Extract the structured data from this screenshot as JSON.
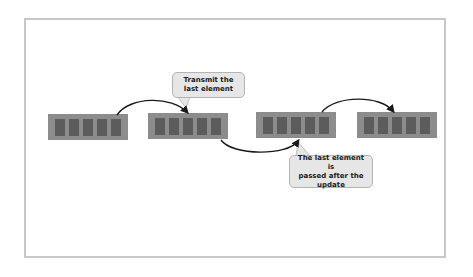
{
  "diagram": {
    "arrays": [
      {
        "id": "array-1",
        "slots": 5
      },
      {
        "id": "array-2",
        "slots": 5
      },
      {
        "id": "array-3",
        "slots": 5
      },
      {
        "id": "array-4",
        "slots": 5
      }
    ],
    "callouts": {
      "top": "Transmit the\nlast element",
      "bottom": "The last element is\npassed after the\nupdate"
    },
    "colors": {
      "array_fill": "#8c8c8c",
      "slot_fill": "#5c5c5c",
      "callout_fill": "#e6e6e6",
      "arrow": "#1a1a1a",
      "frame_border": "#c8c8c8"
    }
  }
}
